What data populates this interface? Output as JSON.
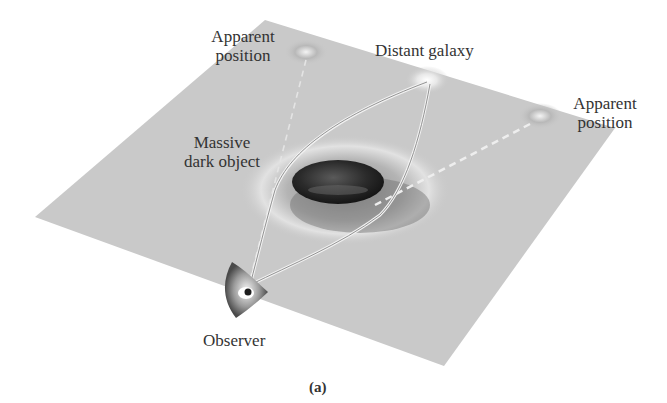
{
  "figure": {
    "caption": "(a)",
    "labels": {
      "apparent_position_left": [
        "Apparent",
        "position"
      ],
      "distant_galaxy": "Distant galaxy",
      "apparent_position_right": [
        "Apparent",
        "position"
      ],
      "massive_dark_object": [
        "Massive",
        "dark object"
      ],
      "observer": "Observer"
    },
    "colors": {
      "plane": "#c9c9c9",
      "dark_object": "#2e2e2e",
      "light_path": "#f0f0f0",
      "dashed_line": "#e6e6e6",
      "text": "#333333"
    }
  }
}
